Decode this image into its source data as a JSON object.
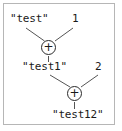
{
  "figure": {
    "border_color": "#b6b6b6",
    "background_color": "#ffffff",
    "text_color": "#1a1a1a",
    "edge_color": "#555555"
  },
  "tree": {
    "levels": [
      {
        "left_operand": "\"test\"",
        "right_operand": "1",
        "operator": "+"
      },
      {
        "left_operand": "\"test1\"",
        "right_operand": "2",
        "operator": "+"
      }
    ],
    "result": "\"test12\""
  },
  "icons": {
    "operator_plus": "plus-operator-icon"
  }
}
